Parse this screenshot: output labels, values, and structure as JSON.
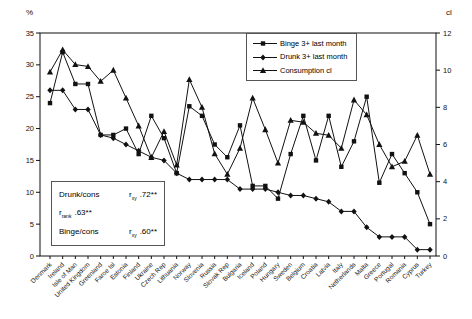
{
  "chart_data": {
    "type": "line",
    "title": "",
    "left_axis": {
      "label": "%",
      "min": 0,
      "max": 35,
      "ticks": [
        0,
        5,
        10,
        15,
        20,
        25,
        30,
        35
      ]
    },
    "right_axis": {
      "label": "cl",
      "min": 0,
      "max": 12,
      "ticks": [
        0,
        2,
        4,
        6,
        8,
        10,
        12
      ]
    },
    "grid": false,
    "legend_position": "top-right-inside",
    "categories": [
      "Denmark",
      "Ireland",
      "Isle of Man",
      "United Kingdom",
      "Greenland",
      "Faroe Isl",
      "Estonia",
      "Finland",
      "Ukraine",
      "Czech Rep",
      "Lithuania",
      "Norway",
      "Slovenia",
      "Russia",
      "Slovak Rep",
      "Bulgaria",
      "Iceland",
      "Poland",
      "Hungary",
      "Sweden",
      "Belgium",
      "Croatia",
      "Latvia",
      "Italy",
      "Netherlands",
      "Malta",
      "Greece",
      "Portugal",
      "Romania",
      "Cyprus",
      "Turkey"
    ],
    "series": [
      {
        "name": "Binge 3+ last month",
        "marker": "square",
        "axis": "left",
        "values": [
          24,
          32,
          27,
          27,
          19,
          19,
          20,
          16,
          22,
          18.5,
          13,
          23.5,
          22,
          17.5,
          15.5,
          20.5,
          11,
          11,
          9,
          16,
          22,
          15,
          22,
          14,
          18,
          25,
          11.5,
          16,
          13,
          10,
          5
        ]
      },
      {
        "name": "Drunk 3+ last month",
        "marker": "diamond",
        "axis": "left",
        "values": [
          26,
          26,
          23,
          23,
          19,
          18.5,
          17.5,
          16.5,
          15.5,
          15,
          13,
          12,
          12,
          12,
          12,
          10.5,
          10.5,
          10.5,
          10,
          9.5,
          9.5,
          9,
          8.5,
          7,
          7,
          4.5,
          3,
          3,
          3,
          1,
          1
        ]
      },
      {
        "name": "Consumption cl",
        "marker": "triangle",
        "axis": "right",
        "values": [
          9.9,
          11.1,
          10.3,
          10.2,
          9.4,
          10,
          8.5,
          7,
          5.3,
          6.7,
          4.9,
          9.5,
          8,
          5.5,
          4.4,
          5.8,
          8.5,
          6.8,
          5,
          7.3,
          7.2,
          6.6,
          6.5,
          5.8,
          8.4,
          7.6,
          6,
          4.8,
          5.1,
          6.5,
          4.4
        ]
      }
    ]
  },
  "annotation": {
    "rows": [
      {
        "left": "Drunk/cons",
        "r": "r",
        "sub": "xy",
        "value": ".72**"
      },
      {
        "left": "",
        "r": "r",
        "sub": "rank",
        "value": ".63**"
      },
      {
        "left": "Binge/cons",
        "r": "r",
        "sub": "xy",
        "value": ".60**"
      }
    ]
  }
}
